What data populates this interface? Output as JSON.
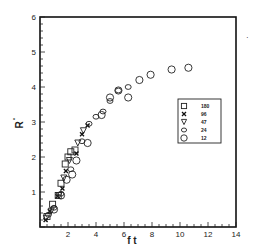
{
  "chart_data": {
    "type": "scatter",
    "title": "",
    "xlabel": "f t",
    "ylabel": "R*",
    "xlim": [
      0,
      14
    ],
    "ylim": [
      0,
      6
    ],
    "x_ticks": [
      2,
      4,
      6,
      8,
      10,
      12,
      14
    ],
    "y_ticks": [
      1,
      2,
      3,
      4,
      5,
      6
    ],
    "grid": false,
    "legend_position": "inside-right",
    "series": [
      {
        "name": "180",
        "marker": "square",
        "x": [
          0.5,
          0.9,
          1.3,
          1.5,
          1.8,
          2.0,
          2.2,
          2.5
        ],
        "y": [
          0.3,
          0.65,
          0.9,
          1.25,
          1.8,
          2.0,
          2.15,
          2.2
        ]
      },
      {
        "name": "96",
        "marker": "x",
        "x": [
          0.4,
          0.7,
          1.25,
          1.6,
          1.85,
          2.6,
          3.0,
          3.4
        ],
        "y": [
          0.2,
          0.45,
          0.88,
          1.1,
          1.6,
          2.1,
          2.65,
          2.9
        ]
      },
      {
        "name": "47",
        "marker": "triangle-down",
        "x": [
          0.45,
          0.8,
          1.35,
          1.7,
          2.1,
          2.7,
          3.1
        ],
        "y": [
          0.25,
          0.45,
          0.9,
          1.4,
          1.9,
          2.4,
          2.75
        ]
      },
      {
        "name": "24",
        "marker": "diamond",
        "x": [
          0.6,
          1.0,
          1.5,
          2.2,
          3.0,
          3.5,
          4.0,
          4.5,
          5.0,
          5.6,
          6.3
        ],
        "y": [
          0.35,
          0.55,
          0.95,
          1.65,
          2.45,
          2.95,
          3.15,
          3.3,
          3.6,
          3.9,
          4.0
        ]
      },
      {
        "name": "12",
        "marker": "circle",
        "x": [
          1.0,
          1.5,
          1.9,
          2.3,
          2.6,
          3.4,
          4.4,
          5.0,
          5.6,
          6.3,
          7.1,
          7.9,
          9.4,
          10.6
        ],
        "y": [
          0.5,
          0.9,
          1.35,
          1.5,
          1.9,
          2.4,
          3.2,
          3.7,
          3.9,
          3.7,
          4.2,
          4.35,
          4.5,
          4.55
        ]
      }
    ]
  },
  "legend": {
    "entries": [
      {
        "label": "180",
        "marker": "square"
      },
      {
        "label": "96",
        "marker": "x"
      },
      {
        "label": "47",
        "marker": "triangle-down"
      },
      {
        "label": "24",
        "marker": "diamond"
      },
      {
        "label": "12",
        "marker": "circle"
      }
    ]
  },
  "axes": {
    "xlabel": "f t",
    "ylabel": "R",
    "ylabel_sup": "*",
    "x_tick_labels": [
      "2",
      "4",
      "6",
      "8",
      "10",
      "12",
      "14"
    ],
    "y_tick_labels": [
      "1",
      "2",
      "3",
      "4",
      "5",
      "6"
    ]
  }
}
